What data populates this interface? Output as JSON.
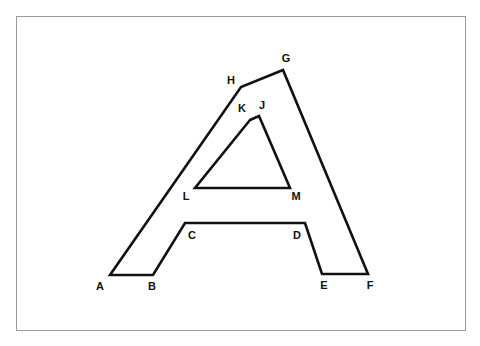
{
  "figure": {
    "background_color": "#ffffff",
    "frame_color": "#9a9a9a",
    "stroke_color": "#111111",
    "label_color": "#111111",
    "stroke_width": 2.6,
    "frame": {
      "x": 16,
      "y": 16,
      "width": 450,
      "height": 315
    }
  },
  "shapes": {
    "outer": {
      "name": "outer-a-outline",
      "closed": true,
      "points": "110,275 153,275 185,223 305,223 322,274 368,274 283,70 241,87"
    },
    "inner": {
      "name": "inner-triangle-outline",
      "closed": true,
      "points": "250,120 259,116 290,188 195,188"
    }
  },
  "labels": [
    {
      "id": "A",
      "text": "A",
      "x": 100,
      "y": 287
    },
    {
      "id": "B",
      "text": "B",
      "x": 152,
      "y": 287
    },
    {
      "id": "C",
      "text": "C",
      "x": 192,
      "y": 236
    },
    {
      "id": "D",
      "text": "D",
      "x": 297,
      "y": 236
    },
    {
      "id": "E",
      "text": "E",
      "x": 324,
      "y": 286
    },
    {
      "id": "F",
      "text": "F",
      "x": 370,
      "y": 286
    },
    {
      "id": "G",
      "text": "G",
      "x": 286,
      "y": 59
    },
    {
      "id": "H",
      "text": "H",
      "x": 231,
      "y": 81
    },
    {
      "id": "J",
      "text": "J",
      "x": 262,
      "y": 106
    },
    {
      "id": "K",
      "text": "K",
      "x": 242,
      "y": 109
    },
    {
      "id": "L",
      "text": "L",
      "x": 186,
      "y": 197
    },
    {
      "id": "M",
      "text": "M",
      "x": 296,
      "y": 197
    }
  ],
  "chart_data": {
    "type": "diagram",
    "vertex_count": 12,
    "vertices": [
      {
        "label": "A",
        "x": 110,
        "y": 275,
        "part": "outer"
      },
      {
        "label": "B",
        "x": 153,
        "y": 275,
        "part": "outer"
      },
      {
        "label": "C",
        "x": 185,
        "y": 223,
        "part": "outer"
      },
      {
        "label": "D",
        "x": 305,
        "y": 223,
        "part": "outer"
      },
      {
        "label": "E",
        "x": 322,
        "y": 274,
        "part": "outer"
      },
      {
        "label": "F",
        "x": 368,
        "y": 274,
        "part": "outer"
      },
      {
        "label": "G",
        "x": 283,
        "y": 70,
        "part": "outer"
      },
      {
        "label": "H",
        "x": 241,
        "y": 87,
        "part": "outer"
      },
      {
        "label": "J",
        "x": 259,
        "y": 116,
        "part": "inner"
      },
      {
        "label": "K",
        "x": 250,
        "y": 120,
        "part": "inner"
      },
      {
        "label": "L",
        "x": 195,
        "y": 188,
        "part": "inner"
      },
      {
        "label": "M",
        "x": 290,
        "y": 188,
        "part": "inner"
      }
    ],
    "edges": [
      "A-B",
      "B-C",
      "C-D",
      "D-E",
      "E-F",
      "F-G",
      "G-H",
      "H-A",
      "J-K",
      "K-L",
      "L-M",
      "M-J"
    ]
  }
}
